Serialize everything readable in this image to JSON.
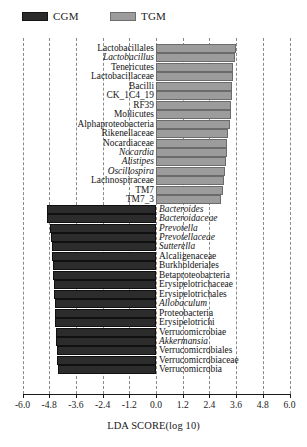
{
  "legend": {
    "entries": [
      {
        "label": "CGM",
        "color": "#2b2b2b",
        "group": "cgm"
      },
      {
        "label": "TGM",
        "color": "#9c9c9c",
        "group": "tgm"
      }
    ]
  },
  "axis": {
    "title": "LDA SCORE(log 10)",
    "tick_labels": [
      "-6.0",
      "-4.8",
      "-3.6",
      "-2.4",
      "-1.2",
      "0.0",
      "1.2",
      "2.4",
      "3.6",
      "4.8",
      "6.0"
    ]
  },
  "chart_data": {
    "type": "bar",
    "orientation": "horizontal",
    "title": "",
    "xlabel": "LDA SCORE(log 10)",
    "ylabel": "",
    "xlim": [
      -6.0,
      6.0
    ],
    "xticks": [
      -6.0,
      -4.8,
      -3.6,
      -2.4,
      -1.2,
      0.0,
      1.2,
      2.4,
      3.6,
      4.8,
      6.0
    ],
    "grid": true,
    "legend_position": "top-left",
    "series": [
      {
        "name": "CGM",
        "color": "#2b2b2b"
      },
      {
        "name": "TGM",
        "color": "#9c9c9c"
      }
    ],
    "bars": [
      {
        "label": "Lactobacillales",
        "value": 3.58,
        "group": "TGM",
        "italic": false
      },
      {
        "label": "Lactobacillus",
        "value": 3.55,
        "group": "TGM",
        "italic": true
      },
      {
        "label": "Tenericutes",
        "value": 3.46,
        "group": "TGM",
        "italic": false
      },
      {
        "label": "Lactobacillaceae",
        "value": 3.44,
        "group": "TGM",
        "italic": false
      },
      {
        "label": "Bacilli",
        "value": 3.42,
        "group": "TGM",
        "italic": false
      },
      {
        "label": "CK_1C4_19",
        "value": 3.4,
        "group": "TGM",
        "italic": false
      },
      {
        "label": "RF39",
        "value": 3.38,
        "group": "TGM",
        "italic": false
      },
      {
        "label": "Mollicutes",
        "value": 3.36,
        "group": "TGM",
        "italic": false
      },
      {
        "label": "Alphaproteobacteria",
        "value": 3.34,
        "group": "TGM",
        "italic": false
      },
      {
        "label": "Rikenellaceae",
        "value": 3.22,
        "group": "TGM",
        "italic": false
      },
      {
        "label": "Nocardiaceae",
        "value": 3.2,
        "group": "TGM",
        "italic": false
      },
      {
        "label": "Nocardia",
        "value": 3.18,
        "group": "TGM",
        "italic": true
      },
      {
        "label": "Alistipes",
        "value": 3.14,
        "group": "TGM",
        "italic": true
      },
      {
        "label": "Oscillospira",
        "value": 3.1,
        "group": "TGM",
        "italic": true
      },
      {
        "label": "Lachnospiraceae",
        "value": 3.06,
        "group": "TGM",
        "italic": false
      },
      {
        "label": "TM7",
        "value": 3.02,
        "group": "TGM",
        "italic": false
      },
      {
        "label": "TM7_3",
        "value": 2.92,
        "group": "TGM",
        "italic": false
      },
      {
        "label": "Bacteroides",
        "value": -4.92,
        "group": "CGM",
        "italic": true
      },
      {
        "label": "Bacteroidaceae",
        "value": -4.88,
        "group": "CGM",
        "italic": true
      },
      {
        "label": "Prevotella",
        "value": -4.78,
        "group": "CGM",
        "italic": true
      },
      {
        "label": "Prevotellaceae",
        "value": -4.7,
        "group": "CGM",
        "italic": true
      },
      {
        "label": "Sutterella",
        "value": -4.68,
        "group": "CGM",
        "italic": true
      },
      {
        "label": "Alcaligenaceae",
        "value": -4.66,
        "group": "CGM",
        "italic": false
      },
      {
        "label": "Burkholderiales",
        "value": -4.64,
        "group": "CGM",
        "italic": false
      },
      {
        "label": "Betaproteobacteria",
        "value": -4.62,
        "group": "CGM",
        "italic": false
      },
      {
        "label": "Erysipelotrichaceae",
        "value": -4.6,
        "group": "CGM",
        "italic": false
      },
      {
        "label": "Erysipelotrichales",
        "value": -4.58,
        "group": "CGM",
        "italic": false
      },
      {
        "label": "Allobaculum",
        "value": -4.56,
        "group": "CGM",
        "italic": true
      },
      {
        "label": "Proteobacteria",
        "value": -4.54,
        "group": "CGM",
        "italic": false
      },
      {
        "label": "Erysipelotrichi",
        "value": -4.52,
        "group": "CGM",
        "italic": false
      },
      {
        "label": "Verrucomicrobiae",
        "value": -4.5,
        "group": "CGM",
        "italic": false
      },
      {
        "label": "Akkermansia",
        "value": -4.48,
        "group": "CGM",
        "italic": true
      },
      {
        "label": "Verrucomicrobiales",
        "value": -4.46,
        "group": "CGM",
        "italic": false
      },
      {
        "label": "Verrucomicrobiaceae",
        "value": -4.44,
        "group": "CGM",
        "italic": false
      },
      {
        "label": "Verrucomicrobia",
        "value": -4.42,
        "group": "CGM",
        "italic": false
      }
    ]
  }
}
